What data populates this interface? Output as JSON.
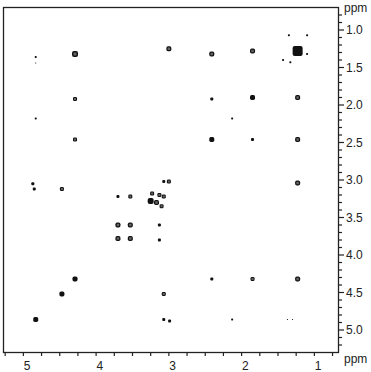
{
  "chart_data": {
    "type": "scatter",
    "subtype": "2D NMR COSY contour plot",
    "title": "",
    "xlabel": "ppm",
    "ylabel": "ppm",
    "x_axis": {
      "reversed": true,
      "ticks": [
        5,
        4,
        3,
        2,
        1
      ],
      "tick_labels": [
        "5",
        "4",
        "3",
        "2",
        "1"
      ],
      "range": [
        5.3,
        0.7
      ]
    },
    "y_axis": {
      "position": "right",
      "reversed": true,
      "ticks": [
        1.0,
        1.5,
        2.0,
        2.5,
        3.0,
        3.5,
        4.0,
        4.5,
        5.0
      ],
      "tick_labels": [
        "1.0",
        "1.5",
        "2.0",
        "2.5",
        "3.0",
        "3.5",
        "4.0",
        "4.5",
        "5.0"
      ],
      "range": [
        0.7,
        5.3
      ]
    },
    "grid": false,
    "legend": null,
    "peaks": [
      {
        "x": 1.28,
        "y": 1.28,
        "size": 10,
        "diag": true
      },
      {
        "x": 1.15,
        "y": 1.07,
        "size": 2
      },
      {
        "x": 1.4,
        "y": 1.07,
        "size": 2
      },
      {
        "x": 1.48,
        "y": 1.4,
        "size": 2
      },
      {
        "x": 1.38,
        "y": 1.43,
        "size": 2
      },
      {
        "x": 1.15,
        "y": 1.32,
        "size": 2
      },
      {
        "x": 4.34,
        "y": 1.32,
        "size": 6
      },
      {
        "x": 3.05,
        "y": 1.25,
        "size": 5
      },
      {
        "x": 2.46,
        "y": 1.32,
        "size": 5
      },
      {
        "x": 1.9,
        "y": 1.28,
        "size": 5
      },
      {
        "x": 4.88,
        "y": 1.36,
        "size": 2
      },
      {
        "x": 4.88,
        "y": 1.44,
        "size": 1
      },
      {
        "x": 4.34,
        "y": 1.92,
        "size": 4
      },
      {
        "x": 2.46,
        "y": 1.92,
        "size": 3
      },
      {
        "x": 1.9,
        "y": 1.9,
        "size": 5,
        "diag": true
      },
      {
        "x": 1.28,
        "y": 1.9,
        "size": 5
      },
      {
        "x": 4.88,
        "y": 2.18,
        "size": 2
      },
      {
        "x": 2.18,
        "y": 2.18,
        "size": 2,
        "diag": true
      },
      {
        "x": 4.34,
        "y": 2.46,
        "size": 4
      },
      {
        "x": 2.46,
        "y": 2.46,
        "size": 5,
        "diag": true
      },
      {
        "x": 1.9,
        "y": 2.46,
        "size": 3
      },
      {
        "x": 1.28,
        "y": 2.46,
        "size": 5
      },
      {
        "x": 4.92,
        "y": 3.05,
        "size": 3
      },
      {
        "x": 4.9,
        "y": 3.12,
        "size": 3
      },
      {
        "x": 4.52,
        "y": 3.12,
        "size": 4
      },
      {
        "x": 1.28,
        "y": 3.04,
        "size": 5
      },
      {
        "x": 3.05,
        "y": 3.02,
        "size": 4
      },
      {
        "x": 3.12,
        "y": 3.02,
        "size": 3
      },
      {
        "x": 3.28,
        "y": 3.18,
        "size": 4
      },
      {
        "x": 3.18,
        "y": 3.2,
        "size": 4
      },
      {
        "x": 3.3,
        "y": 3.28,
        "size": 6,
        "diag": true
      },
      {
        "x": 3.22,
        "y": 3.3,
        "size": 5
      },
      {
        "x": 3.12,
        "y": 3.22,
        "size": 4
      },
      {
        "x": 3.15,
        "y": 3.35,
        "size": 4
      },
      {
        "x": 3.75,
        "y": 3.22,
        "size": 3
      },
      {
        "x": 3.58,
        "y": 3.22,
        "size": 4
      },
      {
        "x": 3.75,
        "y": 3.6,
        "size": 5
      },
      {
        "x": 3.58,
        "y": 3.6,
        "size": 5
      },
      {
        "x": 3.18,
        "y": 3.6,
        "size": 3
      },
      {
        "x": 3.75,
        "y": 3.78,
        "size": 5
      },
      {
        "x": 3.58,
        "y": 3.78,
        "size": 5
      },
      {
        "x": 3.18,
        "y": 3.8,
        "size": 3
      },
      {
        "x": 4.34,
        "y": 4.32,
        "size": 5,
        "diag": true
      },
      {
        "x": 2.46,
        "y": 4.32,
        "size": 3
      },
      {
        "x": 1.9,
        "y": 4.32,
        "size": 4
      },
      {
        "x": 1.28,
        "y": 4.32,
        "size": 5
      },
      {
        "x": 4.52,
        "y": 4.52,
        "size": 5,
        "diag": true
      },
      {
        "x": 3.12,
        "y": 4.52,
        "size": 4
      },
      {
        "x": 4.88,
        "y": 4.86,
        "size": 5,
        "diag": true
      },
      {
        "x": 3.12,
        "y": 4.86,
        "size": 3
      },
      {
        "x": 3.04,
        "y": 4.88,
        "size": 3
      },
      {
        "x": 2.18,
        "y": 4.86,
        "size": 2
      },
      {
        "x": 1.42,
        "y": 4.86,
        "size": 1
      },
      {
        "x": 1.35,
        "y": 4.86,
        "size": 1
      }
    ]
  },
  "axis": {
    "x_unit": "ppm",
    "y_unit": "ppm"
  }
}
